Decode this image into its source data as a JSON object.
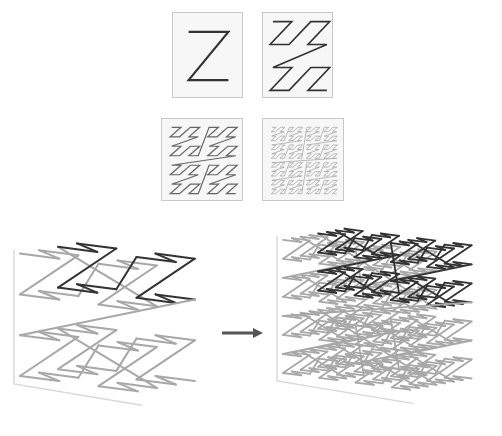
{
  "figure": {
    "colors": {
      "background": "#ffffff",
      "panel_fill": "#f7f7f7",
      "panel_border": "#c9c9c9",
      "curve_dark": "#333333",
      "curve_mid": "#666666",
      "curve_light": "#a8a8a8",
      "curve_faint": "#c8c8c8",
      "axis": "#d8d8d8",
      "arrow": "#555555"
    },
    "panels_2d": [
      {
        "name": "z-order-level-1",
        "x": 172,
        "y": 12,
        "w": 71,
        "h": 86,
        "level": 1
      },
      {
        "name": "z-order-level-2",
        "x": 262,
        "y": 12,
        "w": 71,
        "h": 86,
        "level": 2
      },
      {
        "name": "z-order-level-3",
        "x": 161,
        "y": 118,
        "w": 82,
        "h": 83,
        "level": 3
      },
      {
        "name": "z-order-level-4",
        "x": 262,
        "y": 118,
        "w": 82,
        "h": 83,
        "level": 4
      }
    ],
    "cubes_3d": [
      {
        "name": "z-order-3d-level-1",
        "x": 20,
        "y": 240,
        "w": 190,
        "h": 170,
        "level": 2
      },
      {
        "name": "z-order-3d-level-2",
        "x": 283,
        "y": 225,
        "w": 205,
        "h": 185,
        "level": 3
      }
    ],
    "arrow": {
      "x1": 222,
      "y1": 333,
      "x2": 263,
      "y2": 333
    }
  }
}
